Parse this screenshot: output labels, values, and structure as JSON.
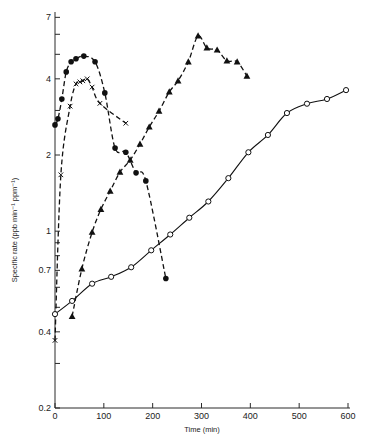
{
  "chart_data": {
    "type": "scatter",
    "title": "",
    "xlabel": "Time (min)",
    "ylabel": "Specific rate (ppb min⁻¹  ppm⁻¹)",
    "xlim": [
      0,
      600
    ],
    "ylim": [
      0.2,
      7
    ],
    "yscale": "log",
    "grid": false,
    "legend": "none",
    "x_ticks": [
      0,
      100,
      200,
      300,
      400,
      500,
      600
    ],
    "y_tick_labels": [
      "0.2",
      "0.4",
      "0.7",
      "1",
      "2",
      "4",
      "7"
    ],
    "y_ticks": [
      0.2,
      0.3,
      0.4,
      0.5,
      0.6,
      0.7,
      0.8,
      0.9,
      1,
      2,
      3,
      4,
      5,
      6,
      7
    ],
    "series": [
      {
        "name": "filled-circles",
        "marker": "filled-circle",
        "line": "dashed",
        "x": [
          0,
          6,
          14,
          23,
          33,
          43,
          59,
          82,
          102,
          123,
          145,
          166,
          186,
          227
        ],
        "y": [
          2.63,
          2.78,
          3.33,
          4.26,
          4.67,
          4.8,
          4.92,
          4.67,
          3.52,
          2.13,
          2.05,
          1.7,
          1.58,
          0.65
        ]
      },
      {
        "name": "crosses",
        "marker": "cross",
        "line": "dashed",
        "x": [
          0,
          12,
          31,
          43,
          51,
          57,
          66,
          76,
          92,
          145
        ],
        "y": [
          0.37,
          1.67,
          3.12,
          3.82,
          3.89,
          3.93,
          4.0,
          3.71,
          3.2,
          2.67
        ]
      },
      {
        "name": "filled-triangles",
        "marker": "filled-triangle",
        "line": "dashed",
        "x": [
          35,
          55,
          76,
          94,
          113,
          133,
          154,
          174,
          193,
          213,
          234,
          252,
          273,
          293,
          311,
          332,
          352,
          373,
          393
        ],
        "y": [
          0.46,
          0.71,
          0.99,
          1.22,
          1.44,
          1.71,
          1.91,
          2.21,
          2.58,
          2.98,
          3.55,
          3.93,
          4.67,
          5.91,
          5.3,
          5.2,
          4.71,
          4.67,
          4.1
        ]
      },
      {
        "name": "open-circles",
        "marker": "open-circle",
        "line": "solid",
        "x": [
          0,
          35,
          76,
          115,
          156,
          197,
          236,
          275,
          314,
          355,
          396,
          436,
          475,
          516,
          557,
          596
        ],
        "y": [
          0.47,
          0.53,
          0.62,
          0.66,
          0.72,
          0.84,
          0.97,
          1.13,
          1.31,
          1.62,
          2.05,
          2.4,
          2.93,
          3.19,
          3.33,
          3.61
        ]
      }
    ]
  }
}
